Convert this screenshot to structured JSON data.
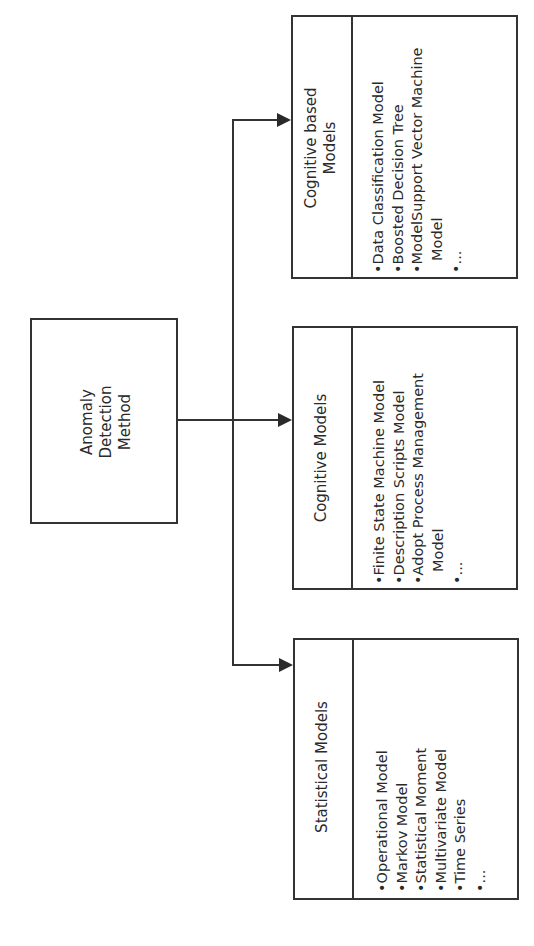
{
  "diagram": {
    "root": {
      "label_lines": [
        "Anomaly",
        "Detection",
        "Method"
      ]
    },
    "branches": [
      {
        "title_lines": [
          "Cognitive based",
          "Models"
        ],
        "items": [
          "•Data Classification Model",
          "•Boosted Decision Tree",
          "•ModelSupport Vector Machine",
          "  Model",
          "•..."
        ]
      },
      {
        "title_lines": [
          "Cognitive Models"
        ],
        "items": [
          "•Finite State Machine Model",
          "•Description Scripts Model",
          "•Adopt Process Management",
          "  Model",
          "•..."
        ]
      },
      {
        "title_lines": [
          "Statistical Models"
        ],
        "items": [
          "•Operational Model",
          "•Markov Model",
          "•Statistical Moment",
          "•Multivariate Model",
          "•Time Series",
          "•..."
        ]
      }
    ],
    "orientation": "rotated -90deg",
    "colors": {
      "stroke": "#333333",
      "background": "#ffffff",
      "text": "#2a2a2a"
    }
  }
}
